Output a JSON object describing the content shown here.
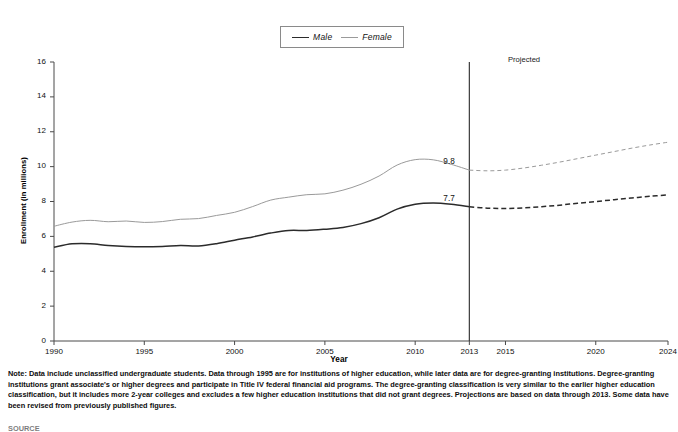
{
  "chart_data": {
    "type": "line",
    "title": "",
    "xlabel": "Year",
    "ylabel": "Enrollment (in millions)",
    "xlim": [
      1990,
      2024
    ],
    "ylim": [
      0,
      16
    ],
    "yticks": [
      0,
      2,
      4,
      6,
      8,
      10,
      12,
      14,
      16
    ],
    "xticks": [
      1990,
      1995,
      2000,
      2005,
      2010,
      2013,
      2015,
      2020,
      2024
    ],
    "grid": false,
    "legend_position": "top-center",
    "projection_start_year": 2013,
    "projected_label": "Projected",
    "series": [
      {
        "name": "Male",
        "style": "solid",
        "color": "#2b2b2b",
        "x": [
          1990,
          1991,
          1992,
          1993,
          1994,
          1995,
          1996,
          1997,
          1998,
          1999,
          2000,
          2001,
          2002,
          2003,
          2004,
          2005,
          2006,
          2007,
          2008,
          2009,
          2010,
          2011,
          2012,
          2013
        ],
        "values": [
          5.38,
          5.57,
          5.58,
          5.48,
          5.42,
          5.4,
          5.42,
          5.47,
          5.45,
          5.58,
          5.78,
          5.97,
          6.19,
          6.34,
          6.34,
          6.41,
          6.51,
          6.73,
          7.07,
          7.56,
          7.84,
          7.91,
          7.84,
          7.7
        ],
        "label_at_projection": "7.7"
      },
      {
        "name": "Female",
        "style": "solid",
        "color": "#9a9a9a",
        "x": [
          1990,
          1991,
          1992,
          1993,
          1994,
          1995,
          1996,
          1997,
          1998,
          1999,
          2000,
          2001,
          2002,
          2003,
          2004,
          2005,
          2006,
          2007,
          2008,
          2009,
          2010,
          2011,
          2012,
          2013
        ],
        "values": [
          6.58,
          6.82,
          6.92,
          6.84,
          6.88,
          6.8,
          6.85,
          6.98,
          7.02,
          7.2,
          7.38,
          7.71,
          8.08,
          8.25,
          8.39,
          8.44,
          8.65,
          8.99,
          9.46,
          10.09,
          10.4,
          10.39,
          10.13,
          9.8
        ],
        "label_at_projection": "9.8"
      },
      {
        "name": "Male projected",
        "style": "dashed",
        "color": "#2b2b2b",
        "x": [
          2013,
          2014,
          2015,
          2016,
          2017,
          2018,
          2019,
          2020,
          2021,
          2022,
          2023,
          2024
        ],
        "values": [
          7.7,
          7.62,
          7.6,
          7.63,
          7.7,
          7.79,
          7.9,
          8.0,
          8.1,
          8.2,
          8.3,
          8.38
        ]
      },
      {
        "name": "Female projected",
        "style": "dashed",
        "color": "#9a9a9a",
        "x": [
          2013,
          2014,
          2015,
          2016,
          2017,
          2018,
          2019,
          2020,
          2021,
          2022,
          2023,
          2024
        ],
        "values": [
          9.8,
          9.76,
          9.8,
          9.92,
          10.08,
          10.26,
          10.46,
          10.66,
          10.86,
          11.06,
          11.24,
          11.4
        ]
      }
    ]
  },
  "legend": {
    "male_label": "Male",
    "female_label": "Female"
  },
  "axis": {
    "ylabel": "Enrollment (in millions)",
    "xlabel": "Year"
  },
  "notes": {
    "text": "Note: Data include unclassified undergraduate students. Data through 1995 are for institutions of higher education, while later data are for degree-granting institutions. Degree-granting institutions grant associate's or higher degrees and participate in Title IV federal financial aid programs. The degree-granting classification is very similar to the earlier higher education classification, but it includes more 2-year colleges and excludes a few higher education institutions that did not grant degrees. Projections are based on data through 2013. Some data have been revised from previously published figures.",
    "source_clipped": "SOURCE"
  }
}
